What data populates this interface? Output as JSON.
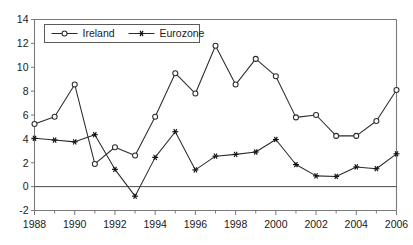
{
  "chart_data": {
    "type": "line",
    "title": "",
    "xlabel": "",
    "ylabel": "",
    "x": [
      1988,
      1989,
      1990,
      1991,
      1992,
      1993,
      1994,
      1995,
      1996,
      1997,
      1998,
      1999,
      2000,
      2001,
      2002,
      2003,
      2004,
      2005,
      2006
    ],
    "xlim": [
      1988,
      2006
    ],
    "ylim": [
      -2,
      14
    ],
    "xticks_major": [
      1988,
      1990,
      1992,
      1994,
      1996,
      1998,
      2000,
      2002,
      2004,
      2006
    ],
    "xtick_labels": [
      "1988",
      "1990",
      "1992",
      "1994",
      "1996",
      "1998",
      "2000",
      "2002",
      "2004",
      "2006"
    ],
    "xticks_minor": [
      1989,
      1991,
      1993,
      1995,
      1997,
      1999,
      2001,
      2003,
      2005
    ],
    "yticks": [
      -2,
      0,
      2,
      4,
      6,
      8,
      10,
      12,
      14
    ],
    "ytick_labels": [
      "-2",
      "0",
      "2",
      "4",
      "6",
      "8",
      "10",
      "12",
      "14"
    ],
    "grid": false,
    "legend_position": "top-left",
    "zero_line": 0,
    "series": [
      {
        "name": "Ireland",
        "marker": "open-circle",
        "values": [
          5.25,
          5.85,
          8.55,
          1.9,
          3.3,
          2.6,
          5.85,
          9.5,
          7.8,
          11.8,
          8.55,
          10.7,
          9.25,
          5.8,
          6.0,
          4.25,
          4.25,
          5.5,
          8.1
        ]
      },
      {
        "name": "Eurozone",
        "marker": "star",
        "values": [
          4.05,
          3.9,
          3.75,
          4.35,
          1.45,
          -0.8,
          2.45,
          4.6,
          1.4,
          2.55,
          2.7,
          2.9,
          3.95,
          1.85,
          0.9,
          0.85,
          1.65,
          1.5,
          2.75
        ]
      }
    ]
  },
  "legend": {
    "items": [
      {
        "label": "Ireland",
        "marker": "open-circle"
      },
      {
        "label": "Eurozone",
        "marker": "star"
      }
    ]
  }
}
